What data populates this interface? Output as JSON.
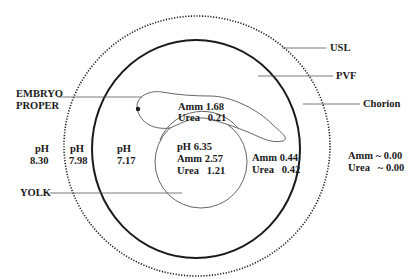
{
  "figure": {
    "type": "schematic",
    "colors": {
      "stroke": "#1a1a1a",
      "thin_stroke": "#555555",
      "background": "#ffffff"
    }
  },
  "labels": {
    "usl": "USL",
    "pvf": "PVF",
    "chorion": "Chorion",
    "embryo_line1": "EMBRYO",
    "embryo_line2": "PROPER",
    "yolk": "YOLK"
  },
  "regions": {
    "outside": {
      "ph_label": "pH",
      "ph_value": "8.30",
      "amm": "Amm ~ 0.00",
      "urea": "Urea   ~ 0.00"
    },
    "usl": {
      "ph_label": "pH",
      "ph_value": "7.98"
    },
    "pvf": {
      "ph_label": "pH",
      "ph_value": "7.17",
      "amm": "Amm 0.44",
      "urea": "Urea   0.42"
    },
    "embryo": {
      "amm": "Amm 1.68",
      "urea": "Urea   0.21"
    },
    "yolk": {
      "ph": "pH 6.35",
      "amm": "Amm 2.57",
      "urea": "Urea   1.21"
    }
  }
}
